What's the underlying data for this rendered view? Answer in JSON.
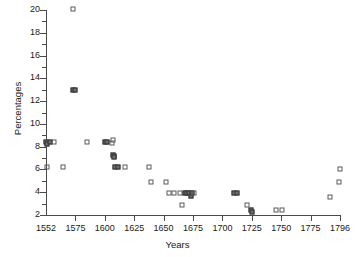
{
  "chart_data": {
    "type": "scatter",
    "title": "",
    "xlabel": "Years",
    "ylabel": "Percentages",
    "xlim": [
      1552,
      1796
    ],
    "ylim": [
      2,
      20
    ],
    "grid": false,
    "legend": null,
    "marker_style": "open-square",
    "xticks": [
      1552,
      1575,
      1600,
      1625,
      1650,
      1675,
      1700,
      1725,
      1750,
      1775,
      1796
    ],
    "xtick_labels": [
      "1552",
      "1575",
      "1600",
      "1625",
      "1650",
      "1675",
      "1700",
      "1725",
      "1750",
      "1775",
      "1796"
    ],
    "yticks": [
      2,
      4,
      6,
      8,
      10,
      12,
      14,
      16,
      18,
      20
    ],
    "ytick_labels": [
      "2",
      "4",
      "6",
      "8",
      "10",
      "12",
      "14",
      "16",
      "18",
      "20"
    ],
    "yticks_minor": [
      3,
      5,
      7,
      9,
      11,
      13,
      15,
      17,
      19
    ],
    "points": [
      {
        "x": 1552,
        "y": 8.4,
        "overlap": true
      },
      {
        "x": 1553,
        "y": 8.2,
        "overlap": true
      },
      {
        "x": 1555,
        "y": 8.4,
        "overlap": true
      },
      {
        "x": 1558,
        "y": 8.4,
        "overlap": false
      },
      {
        "x": 1553,
        "y": 6.2,
        "overlap": false
      },
      {
        "x": 1565,
        "y": 6.2,
        "overlap": false
      },
      {
        "x": 1573,
        "y": 20.1,
        "overlap": false
      },
      {
        "x": 1573,
        "y": 13.0,
        "overlap": true
      },
      {
        "x": 1575,
        "y": 13.0,
        "overlap": true
      },
      {
        "x": 1585,
        "y": 8.4,
        "overlap": false
      },
      {
        "x": 1600,
        "y": 8.4,
        "overlap": true
      },
      {
        "x": 1602,
        "y": 8.4,
        "overlap": true
      },
      {
        "x": 1607,
        "y": 8.6,
        "overlap": false
      },
      {
        "x": 1606,
        "y": 8.3,
        "overlap": false
      },
      {
        "x": 1607,
        "y": 7.3,
        "overlap": true
      },
      {
        "x": 1608,
        "y": 7.2,
        "overlap": true
      },
      {
        "x": 1608,
        "y": 7.1,
        "overlap": true
      },
      {
        "x": 1609,
        "y": 6.2,
        "overlap": true
      },
      {
        "x": 1611,
        "y": 6.2,
        "overlap": true
      },
      {
        "x": 1617,
        "y": 6.2,
        "overlap": false
      },
      {
        "x": 1638,
        "y": 6.2,
        "overlap": false
      },
      {
        "x": 1639,
        "y": 4.9,
        "overlap": false
      },
      {
        "x": 1652,
        "y": 4.9,
        "overlap": false
      },
      {
        "x": 1655,
        "y": 3.9,
        "overlap": false
      },
      {
        "x": 1659,
        "y": 3.9,
        "overlap": false
      },
      {
        "x": 1664,
        "y": 3.9,
        "overlap": false
      },
      {
        "x": 1666,
        "y": 2.9,
        "overlap": false
      },
      {
        "x": 1668,
        "y": 3.9,
        "overlap": true
      },
      {
        "x": 1670,
        "y": 3.9,
        "overlap": true
      },
      {
        "x": 1672,
        "y": 3.9,
        "overlap": true
      },
      {
        "x": 1673,
        "y": 3.7,
        "overlap": true
      },
      {
        "x": 1674,
        "y": 3.9,
        "overlap": true
      },
      {
        "x": 1676,
        "y": 3.9,
        "overlap": false
      },
      {
        "x": 1710,
        "y": 3.9,
        "overlap": true
      },
      {
        "x": 1712,
        "y": 3.9,
        "overlap": true
      },
      {
        "x": 1721,
        "y": 2.9,
        "overlap": false
      },
      {
        "x": 1724,
        "y": 2.4,
        "overlap": true
      },
      {
        "x": 1725,
        "y": 2.3,
        "overlap": true
      },
      {
        "x": 1746,
        "y": 2.4,
        "overlap": false
      },
      {
        "x": 1751,
        "y": 2.4,
        "overlap": false
      },
      {
        "x": 1789,
        "y": 3.6,
        "overlap": false
      },
      {
        "x": 1795,
        "y": 4.9,
        "overlap": false
      },
      {
        "x": 1796,
        "y": 6.0,
        "overlap": false
      }
    ]
  }
}
